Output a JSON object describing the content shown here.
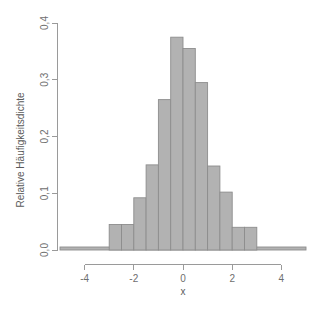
{
  "chart_data": {
    "type": "bar",
    "title": "",
    "subtitle": "",
    "xlabel": "x",
    "ylabel": "Relative Häufigkeitsdichte",
    "xlim": [
      -5,
      5
    ],
    "ylim": [
      0.0,
      0.4
    ],
    "grid": false,
    "legend": null,
    "bin_width": 0.5,
    "x_tick_values": [
      -4,
      -2,
      0,
      2,
      4
    ],
    "x_tick_labels": [
      "-4",
      "-2",
      "0",
      "2",
      "4"
    ],
    "y_tick_values": [
      0.0,
      0.1,
      0.2,
      0.3,
      0.4
    ],
    "y_tick_labels": [
      "0,0",
      "0,1",
      "0,2",
      "0,3",
      "0,4"
    ],
    "bin_edges": [
      -3.0,
      -2.5,
      -2.0,
      -1.5,
      -1.0,
      -0.5,
      0.0,
      0.5,
      1.0,
      1.5,
      2.0,
      2.5,
      3.0
    ],
    "bin_centers": [
      -2.75,
      -2.25,
      -1.75,
      -1.25,
      -0.75,
      -0.25,
      0.25,
      0.75,
      1.25,
      1.75,
      2.25,
      2.75
    ],
    "values": [
      0.045,
      0.045,
      0.092,
      0.15,
      0.265,
      0.375,
      0.355,
      0.295,
      0.148,
      0.102,
      0.04,
      0.04
    ],
    "baseline_extent": [
      -5.0,
      5.0
    ],
    "bar_fill_color": "#b2b2b2",
    "bar_border_color": "#8d8d8d",
    "axis_color": "#9a9a9a",
    "label_color": "#6e6e6e",
    "background_color": "#ffffff"
  },
  "axes": {
    "y_axis_title": "Relative Häufigkeitsdichte",
    "x_axis_title": "x"
  }
}
